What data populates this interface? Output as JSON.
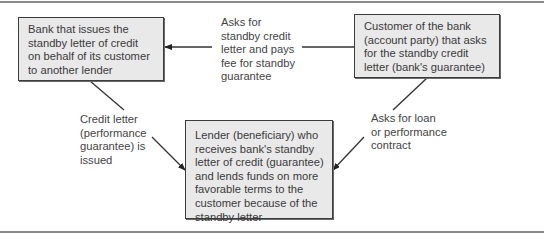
{
  "figure": {
    "nodes": {
      "bank": {
        "lines": [
          "Bank that issues the",
          "standby letter of credit",
          "on behalf of its customer",
          "to another lender"
        ]
      },
      "customer": {
        "lines": [
          "Customer of the bank",
          "(account party) that asks",
          "for the standby credit",
          "letter (bank's guarantee)"
        ]
      },
      "lender": {
        "lines": [
          "Lender (beneficiary) who",
          "receives bank's standby",
          "letter of credit (guarantee)",
          "and lends funds on more",
          "favorable terms to the",
          "customer because of the",
          "standby letter"
        ]
      }
    },
    "edges": {
      "customer_to_bank": {
        "lines": [
          "Asks for",
          "standby credit",
          "letter and pays",
          "fee for standby",
          "guarantee"
        ]
      },
      "bank_to_lender": {
        "lines": [
          "Credit letter",
          "(performance",
          "guarantee) is",
          "issued"
        ]
      },
      "customer_to_lender": {
        "lines": [
          "Asks for loan",
          "or performance",
          "contract"
        ]
      }
    },
    "colors": {
      "box_fill": "#e9e9e9",
      "box_border": "#3c3c3c",
      "line": "#333333",
      "text": "#3a3a3a",
      "rule": "#8a8a8a"
    }
  }
}
